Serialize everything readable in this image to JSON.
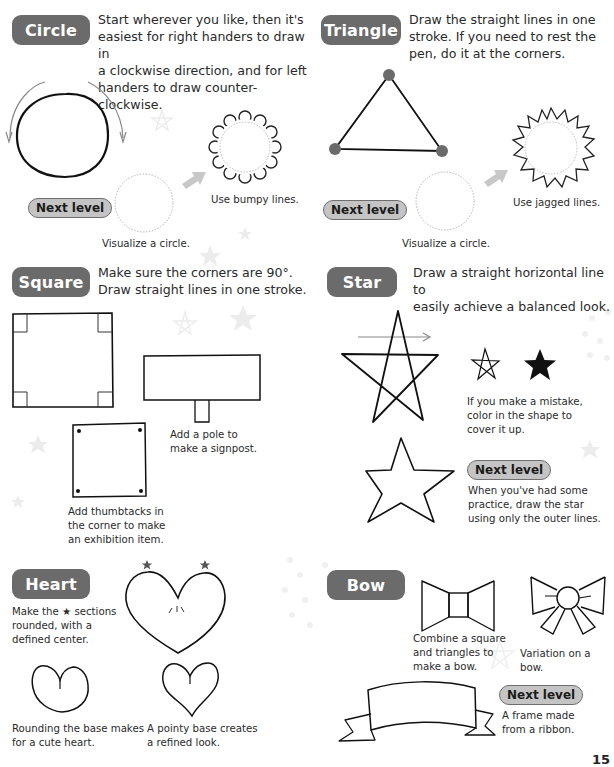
{
  "page_number": "15",
  "colors": {
    "header_pill": "#6b6b6b",
    "next_level_fill": "#c4c4c4",
    "next_level_border": "#6e6e6e",
    "arrow": "#c8c8c8",
    "triangle_dot": "#6b6b6b",
    "ink": "#2a2a2a"
  },
  "sections": {
    "circle": {
      "title": "Circle",
      "intro_lines": [
        "Start wherever you like, then it's",
        "easiest for right handers to draw in",
        "a clockwise direction, and for left",
        "handers to draw counter-clockwise."
      ],
      "next_level": "Next level",
      "captions": {
        "visualize": "Visualize a circle.",
        "result": "Use bumpy lines."
      }
    },
    "triangle": {
      "title": "Triangle",
      "intro_lines": [
        "Draw the straight lines in one",
        "stroke. If you need to rest the",
        "pen, do it at the corners."
      ],
      "next_level": "Next level",
      "captions": {
        "visualize": "Visualize a circle.",
        "result": "Use jagged lines."
      }
    },
    "square": {
      "title": "Square",
      "intro_lines": [
        "Make sure the corners are 90°.",
        "Draw straight lines in one stroke."
      ],
      "captions": {
        "signpost": [
          "Add a pole to",
          "make a signpost."
        ],
        "thumbtacks": [
          "Add thumbtacks in",
          "the corner to make",
          "an exhibition item."
        ]
      }
    },
    "star": {
      "title": "Star",
      "intro_lines": [
        "Draw a straight horizontal line to",
        "easily achieve a balanced look."
      ],
      "next_level": "Next level",
      "captions": {
        "mistake": [
          "If you make a mistake,",
          "color in the shape to",
          "cover it up."
        ],
        "outer": [
          "When you've had some",
          "practice, draw the star",
          "using only the outer lines."
        ]
      }
    },
    "heart": {
      "title": "Heart",
      "intro_lines": [
        "Make the ★ sections",
        "rounded, with a",
        "defined center."
      ],
      "captions": {
        "cute": [
          "Rounding the base makes",
          "for a cute heart."
        ],
        "refined": [
          "A pointy base creates",
          "a refined look."
        ]
      }
    },
    "bow": {
      "title": "Bow",
      "next_level": "Next level",
      "captions": {
        "combine": [
          "Combine a square",
          "and triangles to",
          "make a bow."
        ],
        "variation": "Variation on a bow.",
        "ribbon": [
          "A frame made",
          "from a ribbon."
        ]
      }
    }
  }
}
